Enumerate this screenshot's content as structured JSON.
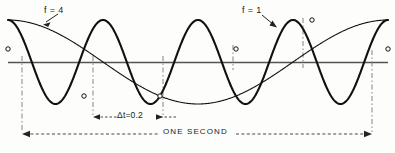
{
  "figure": {
    "background_color": "#fdfdfb",
    "curve_color": "#111111",
    "axis_color": "#555555",
    "dash_color": "#666666",
    "annotations": {
      "label_f4": "f = 4",
      "label_f1": "f = 1",
      "label_delta_t": "Δt=0.2",
      "label_one_second": "ONE SECOND"
    },
    "axis": {
      "y_pixel": 62,
      "x_start": 8,
      "x_end": 388
    },
    "dimension_lines": {
      "one_second": {
        "x_left": 22,
        "x_right": 372,
        "y": 134
      },
      "delta_t": {
        "x_left": 93,
        "x_right": 163,
        "y": 117
      }
    },
    "vertical_guides": [
      22,
      93,
      163,
      233,
      303,
      372
    ]
  },
  "chart_data": {
    "type": "line",
    "xlabel": "ONE SECOND",
    "ylabel": "",
    "xlim": [
      0,
      1
    ],
    "ylim": [
      -1,
      1
    ],
    "grid": false,
    "legend": "inline-annotations",
    "sample_interval": 0.2,
    "sample_interval_label": "Δt=0.2",
    "duration_seconds": 1,
    "duration_label": "ONE SECOND",
    "series": [
      {
        "name": "f = 4",
        "label": "f = 4",
        "frequency_hz": 4,
        "amplitude": 1,
        "phase_deg": 90,
        "color": "#111111",
        "line_width": 2.1,
        "x": [
          0,
          0.05,
          0.1,
          0.15,
          0.2,
          0.25,
          0.3,
          0.35,
          0.4,
          0.45,
          0.5,
          0.55,
          0.6,
          0.65,
          0.7,
          0.75,
          0.8,
          0.85,
          0.9,
          0.95,
          1.0
        ],
        "y": [
          0.31,
          1.0,
          0.31,
          -0.81,
          -0.81,
          0.31,
          1.0,
          0.31,
          -0.81,
          -0.81,
          0.31,
          1.0,
          0.31,
          -0.81,
          -0.81,
          0.31,
          1.0,
          0.31,
          -0.81,
          -0.81,
          0.31
        ]
      },
      {
        "name": "f = 1",
        "label": "f = 1",
        "frequency_hz": 1,
        "amplitude": 1,
        "phase_deg": 90,
        "color": "#111111",
        "line_width": 1.1,
        "x": [
          0,
          0.1,
          0.2,
          0.3,
          0.4,
          0.5,
          0.6,
          0.7,
          0.8,
          0.9,
          1.0
        ],
        "y": [
          0.31,
          -0.45,
          -0.81,
          -0.66,
          -0.1,
          0.45,
          0.84,
          0.98,
          0.81,
          0.45,
          0.31
        ]
      }
    ],
    "sample_points": [
      {
        "t": 0.0,
        "value": 0.31,
        "x_pixel": 22,
        "y_pixel": 49
      },
      {
        "t": 0.2,
        "value": -0.81,
        "x_pixel": 93,
        "y_pixel": 103
      },
      {
        "t": 0.4,
        "value": -0.81,
        "x_pixel": 163,
        "y_pixel": 103
      },
      {
        "t": 0.6,
        "value": 0.31,
        "x_pixel": 233,
        "y_pixel": 51
      },
      {
        "t": 0.8,
        "value": 1.0,
        "x_pixel": 303,
        "y_pixel": 20
      },
      {
        "t": 1.0,
        "value": 0.31,
        "x_pixel": 372,
        "y_pixel": 49
      }
    ]
  }
}
